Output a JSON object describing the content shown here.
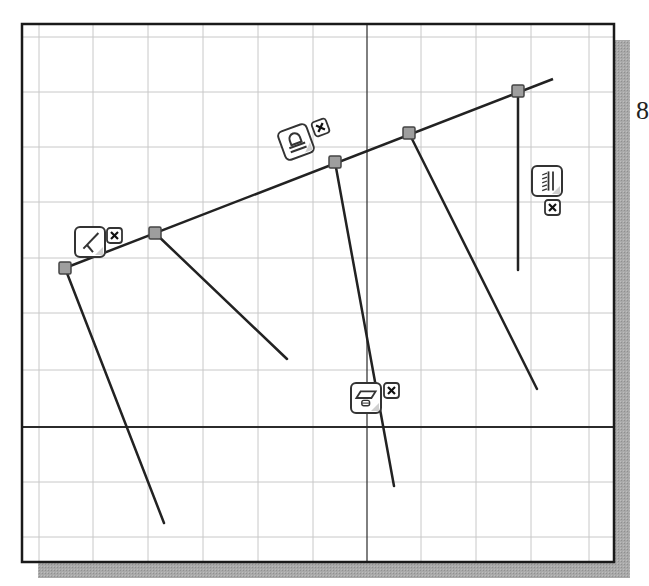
{
  "figure": {
    "page_number_fragment": "8",
    "frame": {
      "x": 22,
      "y": 24,
      "width": 592,
      "height": 538,
      "shadow_offset": 16
    },
    "colors": {
      "background": "#ffffff",
      "frame_border": "#1a1a1a",
      "shadow": "#a6a6a6",
      "grid": "#c8c8c8",
      "axis": "#2b2b2b",
      "sketch_line": "#222222",
      "point_fill": "#9e9e9e",
      "point_stroke": "#444444",
      "constraint_stroke": "#333333"
    },
    "grid": {
      "vertical_x": [
        39,
        93,
        148,
        203,
        258,
        313,
        421,
        476,
        531,
        589
      ],
      "horizontal_y": [
        37,
        92,
        147,
        202,
        258,
        313,
        370,
        482,
        537
      ]
    },
    "axes": {
      "horizontal_axis_y": 427,
      "vertical_axis_x": 367
    },
    "sketch": {
      "main_line": {
        "x1": 65,
        "y1": 268,
        "x2": 553,
        "y2": 79
      },
      "points": [
        {
          "id": "p1",
          "x": 65,
          "y": 268
        },
        {
          "id": "p2",
          "x": 155,
          "y": 233
        },
        {
          "id": "p3",
          "x": 335,
          "y": 162
        },
        {
          "id": "p4",
          "x": 409,
          "y": 133
        },
        {
          "id": "p5",
          "x": 518,
          "y": 91
        }
      ],
      "branch_lines": [
        {
          "from": "p1",
          "x2": 164,
          "y2": 523
        },
        {
          "from": "p2",
          "x2": 287,
          "y2": 359
        },
        {
          "from": "p3",
          "x2": 394,
          "y2": 486
        },
        {
          "from": "p4",
          "x2": 537,
          "y2": 389
        },
        {
          "from": "p5",
          "x2": 518,
          "y2": 270
        }
      ]
    },
    "constraints": [
      {
        "type": "perpendicular",
        "icon": "perpendicular-icon",
        "x": 75,
        "y": 227,
        "size": 30,
        "rotate": 0,
        "delete_x": 107,
        "delete_y": 228
      },
      {
        "type": "parallel",
        "icon": "parallel-icon",
        "x": 281,
        "y": 127,
        "size": 30,
        "rotate": -20,
        "delete_x": 313,
        "delete_y": 120
      },
      {
        "type": "vertical",
        "icon": "vertical-icon",
        "x": 532,
        "y": 166,
        "size": 30,
        "rotate": 0,
        "delete_x": 545,
        "delete_y": 200
      },
      {
        "type": "horizontal",
        "icon": "horizontal-icon",
        "x": 351,
        "y": 383,
        "size": 30,
        "rotate": 0,
        "delete_x": 384,
        "delete_y": 383
      }
    ]
  }
}
